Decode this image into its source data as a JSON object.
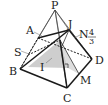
{
  "diagram": {
    "labels": {
      "P": "P",
      "A": "A",
      "J": "J",
      "N": "N",
      "S": "S",
      "B": "B",
      "I": "I",
      "D": "D",
      "M": "M",
      "C": "C",
      "frac_num": "4",
      "frac_den": "3"
    },
    "colors": {
      "line": "#222222",
      "thin_line": "#555555",
      "shade": "#b8b8b8",
      "background": "#ffffff"
    }
  }
}
